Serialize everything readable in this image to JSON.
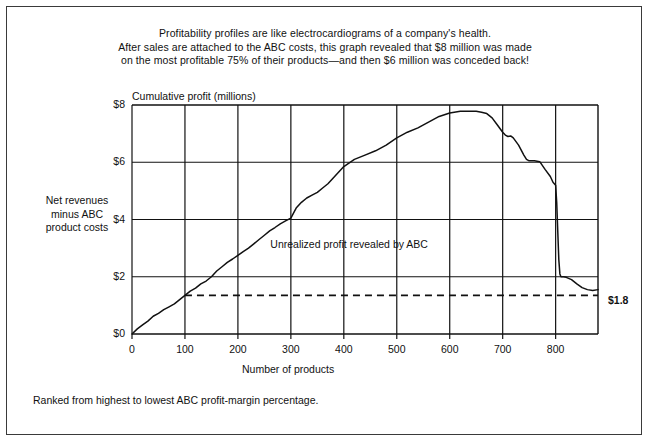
{
  "caption": {
    "lines": [
      "Profitability profiles are like electrocardiograms of a company's health.",
      "After sales are attached to the ABC costs, this graph revealed that $8 million was made",
      "on the most profitable 75% of their products—and then $6 million was conceded back!"
    ]
  },
  "side_label": {
    "lines": [
      "Net revenues",
      "minus ABC",
      "product costs"
    ]
  },
  "footnote": "Ranked from highest to lowest ABC profit-margin percentage.",
  "end_label": "$1.8",
  "annotation": "Unrealized profit revealed by ABC",
  "chart_data": {
    "type": "line",
    "title": "Cumulative profit (millions)",
    "xlabel": "Number of products",
    "ylabel": "Cumulative profit (millions)",
    "xlim": [
      0,
      880
    ],
    "ylim": [
      0,
      8
    ],
    "grid": true,
    "legend": null,
    "xticks": [
      0,
      100,
      200,
      300,
      400,
      500,
      600,
      700,
      800
    ],
    "xticklabels": [
      "0",
      "100",
      "200",
      "300",
      "400",
      "500",
      "600",
      "700",
      "800"
    ],
    "yticks": [
      0,
      2,
      4,
      6,
      8
    ],
    "yticklabels": [
      "$0",
      "$2",
      "$4",
      "$6",
      "$8"
    ],
    "annotations": [
      {
        "text": "Unrealized profit revealed by ABC",
        "x": 410,
        "y": 3.0
      },
      {
        "text": "$1.8",
        "x": 890,
        "y": 1.55
      }
    ],
    "reference_line": {
      "label": "$1.8",
      "y": 1.35,
      "x_start": 100,
      "x_end": 880,
      "style": "dashed"
    },
    "series": [
      {
        "name": "Cumulative profit",
        "x": [
          0,
          10,
          20,
          30,
          40,
          50,
          60,
          70,
          80,
          90,
          100,
          110,
          120,
          130,
          140,
          150,
          160,
          170,
          180,
          190,
          200,
          210,
          220,
          230,
          240,
          250,
          260,
          270,
          280,
          290,
          300,
          310,
          320,
          330,
          340,
          350,
          360,
          370,
          380,
          390,
          400,
          420,
          440,
          460,
          480,
          500,
          520,
          540,
          560,
          580,
          600,
          620,
          640,
          650,
          660,
          670,
          680,
          690,
          700,
          705,
          710,
          715,
          720,
          730,
          740,
          745,
          750,
          760,
          770,
          780,
          790,
          795,
          800,
          802,
          804,
          806,
          808,
          810,
          815,
          820,
          830,
          840,
          850,
          860,
          870,
          880
        ],
        "y": [
          0.0,
          0.18,
          0.32,
          0.45,
          0.62,
          0.72,
          0.85,
          0.95,
          1.05,
          1.2,
          1.35,
          1.5,
          1.6,
          1.75,
          1.85,
          2.0,
          2.2,
          2.35,
          2.5,
          2.62,
          2.75,
          2.88,
          3.0,
          3.15,
          3.3,
          3.45,
          3.6,
          3.72,
          3.85,
          3.95,
          4.05,
          4.4,
          4.6,
          4.75,
          4.85,
          4.95,
          5.1,
          5.25,
          5.45,
          5.65,
          5.85,
          6.1,
          6.25,
          6.4,
          6.6,
          6.85,
          7.05,
          7.2,
          7.4,
          7.6,
          7.72,
          7.78,
          7.78,
          7.78,
          7.75,
          7.7,
          7.55,
          7.3,
          7.05,
          6.95,
          6.9,
          6.92,
          6.85,
          6.6,
          6.25,
          6.1,
          6.05,
          6.05,
          6.02,
          5.75,
          5.5,
          5.3,
          5.2,
          4.6,
          3.6,
          2.6,
          2.1,
          2.0,
          2.0,
          1.98,
          1.9,
          1.75,
          1.62,
          1.55,
          1.52,
          1.55
        ]
      }
    ]
  }
}
